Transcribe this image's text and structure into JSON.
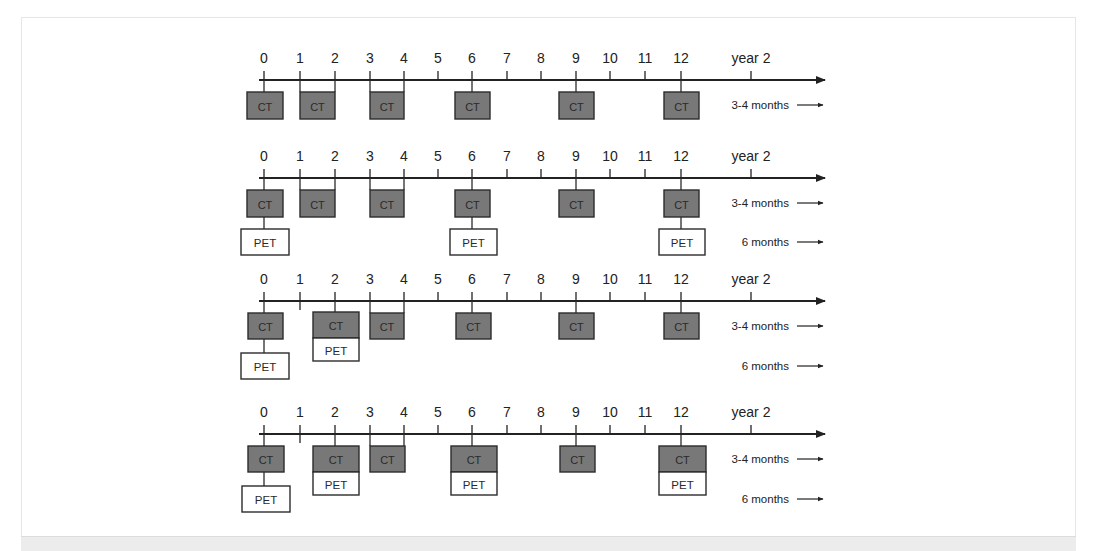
{
  "figure": {
    "tick_labels": [
      "0",
      "1",
      "2",
      "3",
      "4",
      "5",
      "6",
      "7",
      "8",
      "9",
      "10",
      "11",
      "12",
      "year 2"
    ],
    "tick_x": [
      264,
      300,
      335,
      370,
      404,
      438,
      472,
      507,
      541,
      576,
      610,
      645,
      681,
      751
    ],
    "axis": {
      "x_start": 259,
      "x_end": 825
    },
    "colors": {
      "ct_fill": "#787878",
      "ct_stroke": "#2b2b2b",
      "pet_fill": "#ffffff",
      "pet_stroke": "#2b2b2b",
      "axis": "#222222"
    },
    "intervals": {
      "ct": "3-4 months",
      "pet": "6 months"
    },
    "rows": [
      {
        "id": "scheme-1",
        "label_y": 58,
        "axis_y": 80,
        "short_ticks": [],
        "ct": [
          {
            "type": "single",
            "x": 247,
            "w": 36,
            "y": 92,
            "h": 27,
            "stem": 0,
            "label": "CT"
          },
          {
            "type": "bracket",
            "x": 300,
            "w": 35,
            "y": 92,
            "h": 27,
            "from": 1,
            "to": 2,
            "label": "CT"
          },
          {
            "type": "bracket",
            "x": 370,
            "w": 34,
            "y": 92,
            "h": 27,
            "from": 3,
            "to": 4,
            "label": "CT"
          },
          {
            "type": "single",
            "x": 455,
            "w": 35,
            "y": 92,
            "h": 27,
            "stem": 6,
            "label": "CT"
          },
          {
            "type": "single",
            "x": 559,
            "w": 35,
            "y": 92,
            "h": 27,
            "stem": 9,
            "label": "CT"
          },
          {
            "type": "single",
            "x": 664,
            "w": 35,
            "y": 92,
            "h": 27,
            "stem": 12,
            "label": "CT"
          }
        ],
        "pet": [],
        "combined": [],
        "ct_interval_y": 105,
        "pet_interval_y": null
      },
      {
        "id": "scheme-2",
        "label_y": 156,
        "axis_y": 178,
        "short_ticks": [],
        "ct": [
          {
            "type": "single",
            "x": 247,
            "w": 36,
            "y": 190,
            "h": 27,
            "stem": 0,
            "label": "CT"
          },
          {
            "type": "bracket",
            "x": 300,
            "w": 35,
            "y": 190,
            "h": 27,
            "from": 1,
            "to": 2,
            "label": "CT"
          },
          {
            "type": "bracket",
            "x": 370,
            "w": 34,
            "y": 190,
            "h": 27,
            "from": 3,
            "to": 4,
            "label": "CT"
          },
          {
            "type": "single",
            "x": 455,
            "w": 35,
            "y": 190,
            "h": 27,
            "stem": 6,
            "label": "CT"
          },
          {
            "type": "single",
            "x": 559,
            "w": 35,
            "y": 190,
            "h": 27,
            "stem": 9,
            "label": "CT"
          },
          {
            "type": "single",
            "x": 664,
            "w": 35,
            "y": 190,
            "h": 27,
            "stem": 12,
            "label": "CT"
          }
        ],
        "pet": [
          {
            "x": 241,
            "w": 48,
            "y": 229,
            "h": 26,
            "stem": 0,
            "stem_from": 217,
            "label": "PET"
          },
          {
            "x": 450,
            "w": 47,
            "y": 229,
            "h": 26,
            "stem": 6,
            "stem_from": 217,
            "label": "PET"
          },
          {
            "x": 659,
            "w": 46,
            "y": 229,
            "h": 26,
            "stem": 12,
            "stem_from": 217,
            "label": "PET"
          }
        ],
        "combined": [],
        "ct_interval_y": 203,
        "pet_interval_y": 242
      },
      {
        "id": "scheme-3",
        "label_y": 279,
        "axis_y": 301,
        "short_ticks": [
          1
        ],
        "ct": [
          {
            "type": "single",
            "x": 248,
            "w": 35,
            "y": 313,
            "h": 26,
            "stem": 0,
            "label": "CT"
          },
          {
            "type": "bracket",
            "x": 370,
            "w": 34,
            "y": 313,
            "h": 26,
            "from": 3,
            "to": 4,
            "label": "CT"
          },
          {
            "type": "single",
            "x": 456,
            "w": 35,
            "y": 313,
            "h": 26,
            "stem": 6,
            "label": "CT"
          },
          {
            "type": "single",
            "x": 559,
            "w": 35,
            "y": 313,
            "h": 26,
            "stem": 9,
            "label": "CT"
          },
          {
            "type": "single",
            "x": 664,
            "w": 35,
            "y": 313,
            "h": 26,
            "stem": 12,
            "label": "CT"
          }
        ],
        "pet": [
          {
            "x": 241,
            "w": 48,
            "y": 353,
            "h": 26,
            "stem": 0,
            "stem_from": 339,
            "label": "PET"
          }
        ],
        "combined": [
          {
            "x": 313,
            "w": 46,
            "y": 312,
            "ct_h": 26,
            "pet_h": 23,
            "stem": 2,
            "ct_label": "CT",
            "pet_label": "PET"
          }
        ],
        "ct_interval_y": 326,
        "pet_interval_y": 366
      },
      {
        "id": "scheme-4",
        "label_y": 412,
        "axis_y": 434,
        "short_ticks": [
          1
        ],
        "ct": [
          {
            "type": "single",
            "x": 248,
            "w": 36,
            "y": 446,
            "h": 26,
            "stem": 0,
            "label": "CT"
          },
          {
            "type": "bracket",
            "x": 370,
            "w": 35,
            "y": 446,
            "h": 26,
            "from": 3,
            "to": 4,
            "label": "CT"
          },
          {
            "type": "single",
            "x": 560,
            "w": 35,
            "y": 446,
            "h": 26,
            "stem": 9,
            "label": "CT"
          }
        ],
        "pet": [
          {
            "x": 242,
            "w": 48,
            "y": 486,
            "h": 26,
            "stem": 0,
            "stem_from": 472,
            "label": "PET"
          }
        ],
        "combined": [
          {
            "x": 313,
            "w": 46,
            "y": 446,
            "ct_h": 26,
            "pet_h": 23,
            "stem": 2,
            "ct_label": "CT",
            "pet_label": "PET"
          },
          {
            "x": 451,
            "w": 46,
            "y": 446,
            "ct_h": 26,
            "pet_h": 23,
            "stem": 6,
            "ct_label": "CT",
            "pet_label": "PET"
          },
          {
            "x": 659,
            "w": 47,
            "y": 446,
            "ct_h": 26,
            "pet_h": 23,
            "stem": 12,
            "ct_label": "CT",
            "pet_label": "PET"
          }
        ],
        "ct_interval_y": 459,
        "pet_interval_y": 499
      }
    ]
  }
}
